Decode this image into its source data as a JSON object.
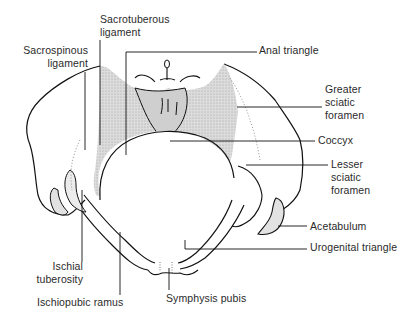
{
  "diagram": {
    "colors": {
      "outline": "#111111",
      "ligament_fill": "#d4d4d4",
      "background": "#ffffff",
      "label_text": "#2a2a2a"
    },
    "labels": {
      "sacrotuberous": {
        "line1": "Sacrotuberous",
        "line2": "ligament"
      },
      "sacrospinous": {
        "line1": "Sacrospinous",
        "line2": "ligament"
      },
      "anal_triangle": "Anal triangle",
      "greater_sciatic": {
        "line1": "Greater",
        "line2": "sciatic",
        "line3": "foramen"
      },
      "coccyx": "Coccyx",
      "lesser_sciatic": {
        "line1": "Lesser",
        "line2": "sciatic",
        "line3": "foramen"
      },
      "acetabulum": "Acetabulum",
      "urogenital_triangle": "Urogenital triangle",
      "ischial_tuberosity": {
        "line1": "Ischial",
        "line2": "tuberosity"
      },
      "ischiopubic_ramus": "Ischiopubic ramus",
      "symphysis_pubis": "Symphysis pubis"
    }
  }
}
